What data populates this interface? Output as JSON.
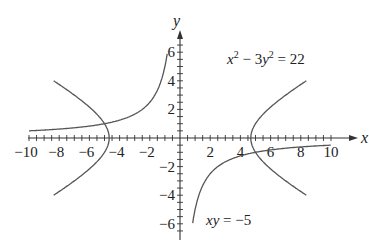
{
  "chart_data": {
    "type": "line",
    "title": "",
    "xlabel": "x",
    "ylabel": "y",
    "xlim": [
      -10.5,
      10.5
    ],
    "ylim": [
      -6.5,
      6.5
    ],
    "x_ticks": [
      -10,
      -8,
      -6,
      -4,
      -2,
      2,
      4,
      6,
      8,
      10
    ],
    "x_tick_labels": [
      "−10",
      "−8",
      "−6",
      "−4",
      "−2",
      "2",
      "4",
      "6",
      "8",
      "10"
    ],
    "y_ticks": [
      6,
      4,
      2,
      -2,
      -4,
      -6
    ],
    "y_tick_labels": [
      "6",
      "4",
      "2",
      "−2",
      "−4",
      "−6"
    ],
    "minor_tick_step": 0.5,
    "grid": false,
    "series": [
      {
        "name": "x^2 - 3y^2 = 22",
        "equation": "x² − 3y² = 22",
        "kind": "hyperbola",
        "branches": 2
      },
      {
        "name": "xy = -5",
        "equation": "xy = −5",
        "kind": "hyperbola",
        "branches": 2
      }
    ],
    "annotations": [
      {
        "text": "x² − 3y² = 22",
        "position": "upper right"
      },
      {
        "text": "xy = −5",
        "position": "lower right"
      }
    ]
  },
  "labels": {
    "x_axis": "x",
    "y_axis": "y",
    "eq1": {
      "a": "x",
      "a_exp": "2",
      "op": " − 3",
      "b": "y",
      "b_exp": "2",
      "rhs": " = 22"
    },
    "eq2": {
      "lhs": "xy",
      "rhs": " = −5"
    }
  }
}
